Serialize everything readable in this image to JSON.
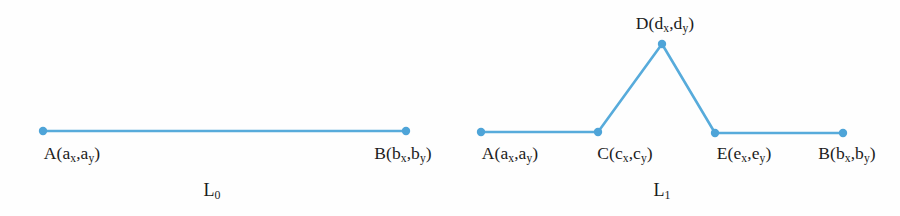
{
  "figure": {
    "background_color": "#fefefe",
    "stroke_color": "#57ABDB",
    "vertex_color": "#4EA4D8",
    "stroke_width": 2.6,
    "vertex_radius": 4.2,
    "text_color": "#1c1c1c",
    "width": 900,
    "height": 216
  },
  "chart_data": {
    "type": "line",
    "title": "",
    "xlabel": "",
    "ylabel": "",
    "grid": false,
    "legend": null,
    "xlim": [
      0,
      900
    ],
    "ylim": [
      216,
      0
    ],
    "series": [
      {
        "name": "L0",
        "points": [
          {
            "id": "A",
            "x": 43,
            "y": 131
          },
          {
            "id": "B",
            "x": 406,
            "y": 131
          }
        ]
      },
      {
        "name": "L1",
        "points": [
          {
            "id": "A",
            "x": 481,
            "y": 132
          },
          {
            "id": "C",
            "x": 598,
            "y": 132
          },
          {
            "id": "D",
            "x": 662,
            "y": 44
          },
          {
            "id": "E",
            "x": 715,
            "y": 133
          },
          {
            "id": "B",
            "x": 843,
            "y": 133
          }
        ]
      }
    ]
  },
  "panels": [
    {
      "key": "left",
      "curve_label": {
        "base": "L",
        "sub": "0",
        "x": 212,
        "y": 181
      },
      "labels": [
        {
          "key": "A",
          "base": "A(a",
          "sub1": "x",
          "mid": ",a",
          "sub2": "y",
          "tail": ")",
          "x": 72,
          "y": 145
        },
        {
          "key": "B",
          "base": "B(b",
          "sub1": "x",
          "mid": ",b",
          "sub2": "y",
          "tail": ")",
          "x": 403,
          "y": 145
        }
      ]
    },
    {
      "key": "right",
      "curve_label": {
        "base": "L",
        "sub": "1",
        "x": 662,
        "y": 181
      },
      "labels": [
        {
          "key": "A",
          "base": "A(a",
          "sub1": "x",
          "mid": ",a",
          "sub2": "y",
          "tail": ")",
          "x": 510,
          "y": 145
        },
        {
          "key": "C",
          "base": "C(c",
          "sub1": "x",
          "mid": ",c",
          "sub2": "y",
          "tail": ")",
          "x": 625,
          "y": 145
        },
        {
          "key": "E",
          "base": "E(e",
          "sub1": "x",
          "mid": ",e",
          "sub2": "y",
          "tail": ")",
          "x": 744,
          "y": 145
        },
        {
          "key": "B",
          "base": "B(b",
          "sub1": "x",
          "mid": ",b",
          "sub2": "y",
          "tail": ")",
          "x": 847,
          "y": 145
        },
        {
          "key": "D",
          "base": "D(d",
          "sub1": "x",
          "mid": ",d",
          "sub2": "y",
          "tail": ")",
          "x": 665,
          "y": 15
        }
      ]
    }
  ]
}
